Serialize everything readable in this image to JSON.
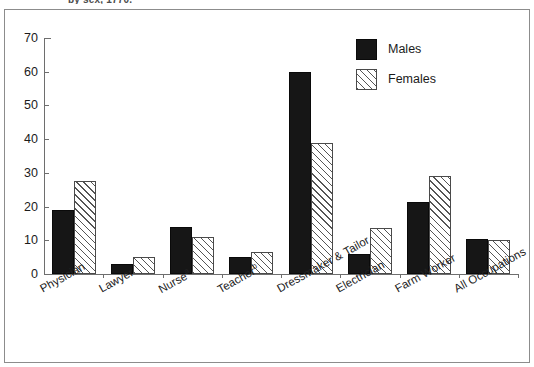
{
  "title_fragment": "by sex, 1770.",
  "chart_data": {
    "type": "bar",
    "title": "",
    "xlabel": "",
    "ylabel": "",
    "ylim": [
      0,
      70
    ],
    "ytick_step": 10,
    "yticks": [
      70,
      60,
      50,
      40,
      30,
      20,
      10,
      0
    ],
    "grid": false,
    "legend_position": "top-right",
    "categories": [
      "Physician",
      "Nursea",
      "Lawyer",
      "Teacherb",
      "Dressmaker & Tailor",
      "Electrician",
      "Farm Worker",
      "All Occupations"
    ],
    "category_labels": [
      {
        "text": "Physician",
        "footnote": ""
      },
      {
        "text": "Lawyer",
        "footnote": ""
      },
      {
        "text": "Nurse",
        "footnote": "a"
      },
      {
        "text": "Teacher",
        "footnote": "b"
      },
      {
        "text": "Dressmaker & Tailor",
        "footnote": ""
      },
      {
        "text": "Electrician",
        "footnote": ""
      },
      {
        "text": "Farm Worker",
        "footnote": ""
      },
      {
        "text": "All Occupations",
        "footnote": ""
      }
    ],
    "series": [
      {
        "name": "Males",
        "color": "#161616",
        "pattern": "solid",
        "values": [
          19,
          3,
          14,
          5,
          60,
          6,
          21.5,
          10.5
        ]
      },
      {
        "name": "Females",
        "color": "#ffffff",
        "pattern": "diagonal-hatch",
        "values": [
          27.5,
          5,
          11,
          6.5,
          39,
          13.5,
          29,
          10
        ]
      }
    ]
  },
  "legend": {
    "items": [
      {
        "label": "Males"
      },
      {
        "label": "Females"
      }
    ]
  },
  "axis": {
    "y_labels": [
      "70",
      "60",
      "50",
      "40",
      "30",
      "20",
      "10",
      "0"
    ]
  }
}
